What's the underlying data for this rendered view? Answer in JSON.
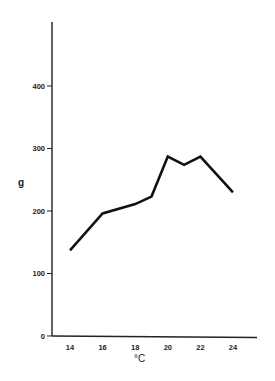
{
  "chart_data": {
    "type": "line",
    "title": "",
    "xlabel": "°C",
    "ylabel": "g",
    "x": [
      14,
      16,
      18,
      19,
      20,
      21,
      22,
      24
    ],
    "series": [
      {
        "name": "weight",
        "values": [
          137,
          196,
          211,
          223,
          287,
          274,
          287,
          230
        ]
      }
    ],
    "xticks": [
      "14",
      "16",
      "18",
      "20",
      "22",
      "24"
    ],
    "yticks": [
      "0",
      "100",
      "200",
      "300",
      "400"
    ],
    "xlim": [
      13,
      25.5
    ],
    "ylim": [
      0,
      500
    ],
    "grid": false,
    "legend": null
  },
  "labels": {
    "y_axis": "g",
    "x_axis": "°C"
  }
}
